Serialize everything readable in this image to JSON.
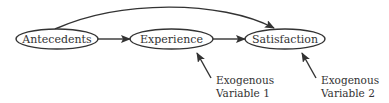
{
  "diagram": {
    "nodes": [
      {
        "id": "antecedents",
        "label": "Antecedents"
      },
      {
        "id": "experience",
        "label": "Experience"
      },
      {
        "id": "satisfaction",
        "label": "Satisfaction"
      }
    ],
    "edges": [
      {
        "from": "antecedents",
        "to": "experience"
      },
      {
        "from": "experience",
        "to": "satisfaction"
      },
      {
        "from": "antecedents",
        "to": "satisfaction",
        "curved": true
      }
    ],
    "exogenous": [
      {
        "line1": "Exogenous",
        "line2": "Variable 1",
        "target": "experience"
      },
      {
        "line1": "Exogenous",
        "line2": "Variable 2",
        "target": "satisfaction"
      }
    ]
  }
}
